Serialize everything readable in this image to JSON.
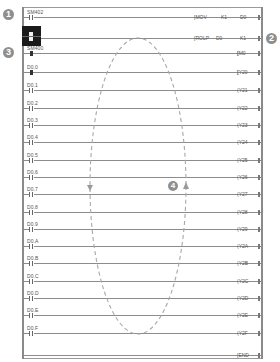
{
  "markers": [
    {
      "id": "1",
      "label": "1",
      "x": 3,
      "y": 9
    },
    {
      "id": "2",
      "label": "2",
      "x": 266,
      "y": 33
    },
    {
      "id": "3",
      "label": "3",
      "x": 3,
      "y": 47
    },
    {
      "id": "4",
      "label": "4",
      "x": 168,
      "y": 181
    }
  ],
  "rungs": [
    {
      "contact_label": "SM402",
      "contact_state": "off",
      "instruction": "MOV",
      "operand1": "K1",
      "operand2": "D0",
      "y": 17
    },
    {
      "contact_label": "",
      "contact_state": "cursor",
      "instruction": "ROLP",
      "operand1": "D0",
      "operand2": "K1",
      "y": 38
    },
    {
      "contact_label": "SM400",
      "contact_state": "on",
      "coil": "M0",
      "y": 53
    },
    {
      "contact_label": "D0.0",
      "contact_state": "on",
      "coil": "Y20",
      "y": 72
    },
    {
      "contact_label": "D0.1",
      "contact_state": "off",
      "coil": "Y21",
      "y": 90
    },
    {
      "contact_label": "D0.2",
      "contact_state": "off",
      "coil": "Y22",
      "y": 108
    },
    {
      "contact_label": "D0.3",
      "contact_state": "off",
      "coil": "Y23",
      "y": 125
    },
    {
      "contact_label": "D0.4",
      "contact_state": "off",
      "coil": "Y24",
      "y": 142
    },
    {
      "contact_label": "D0.5",
      "contact_state": "off",
      "coil": "Y25",
      "y": 160
    },
    {
      "contact_label": "D0.6",
      "contact_state": "off",
      "coil": "Y26",
      "y": 177
    },
    {
      "contact_label": "D0.7",
      "contact_state": "off",
      "coil": "Y27",
      "y": 194
    },
    {
      "contact_label": "D0.8",
      "contact_state": "off",
      "coil": "Y28",
      "y": 212
    },
    {
      "contact_label": "D0.9",
      "contact_state": "off",
      "coil": "Y29",
      "y": 229
    },
    {
      "contact_label": "D0.A",
      "contact_state": "off",
      "coil": "Y2A",
      "y": 246
    },
    {
      "contact_label": "D0.B",
      "contact_state": "off",
      "coil": "Y2B",
      "y": 263
    },
    {
      "contact_label": "D0.C",
      "contact_state": "off",
      "coil": "Y2C",
      "y": 281
    },
    {
      "contact_label": "D0.D",
      "contact_state": "off",
      "coil": "Y2D",
      "y": 298
    },
    {
      "contact_label": "D0.E",
      "contact_state": "off",
      "coil": "Y2E",
      "y": 315
    },
    {
      "contact_label": "D0.F",
      "contact_state": "off",
      "coil": "Y2F",
      "y": 333
    },
    {
      "contact_label": "",
      "contact_state": "none",
      "coil": "END",
      "y": 355
    }
  ],
  "annotation": {
    "shape": "dashed-ellipse",
    "color": "#a8a8a8",
    "center_x": 138,
    "center_y": 186,
    "radius_x": 48,
    "radius_y": 148,
    "arrows": [
      {
        "side": "left",
        "direction": "down"
      },
      {
        "side": "right",
        "direction": "up"
      }
    ]
  },
  "colors": {
    "line": "#8c8c8c",
    "text": "#555555",
    "marker_bg": "#8f8f8f",
    "cursor": "#1a1a1a"
  }
}
